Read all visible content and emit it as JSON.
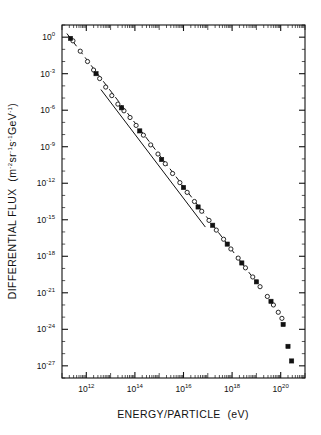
{
  "chart_data": {
    "type": "scatter",
    "title": "",
    "xlabel": "ENERGY/PARTICLE  (eV)",
    "ylabel": "DIFFERENTIAL FLUX  (m⁻²sr⁻¹s⁻¹GeV⁻¹)",
    "xscale": "log",
    "yscale": "log",
    "xlim": [
      100000000000.0,
      1e+21
    ],
    "ylim": [
      1e-28,
      10.0
    ],
    "grid": false,
    "legend": "none",
    "x_tick_labels": [
      "10^12",
      "10^14",
      "10^16",
      "10^18",
      "10^20"
    ],
    "x_tick_exponents": [
      12,
      14,
      16,
      18,
      20
    ],
    "y_tick_labels": [
      "10^0",
      "10^-3",
      "10^-6",
      "10^-9",
      "10^-12",
      "10^-15",
      "10^-18",
      "10^-21",
      "10^-24",
      "10^-27"
    ],
    "y_tick_exponents": [
      0,
      -3,
      -6,
      -9,
      -12,
      -15,
      -18,
      -21,
      -24,
      -27
    ],
    "series": [
      {
        "name": "open-circles",
        "marker": "open-circle",
        "points": [
          [
            11.45,
            -0.3
          ],
          [
            11.75,
            -1.15
          ],
          [
            12.05,
            -2.0
          ],
          [
            12.3,
            -2.7
          ],
          [
            12.55,
            -3.4
          ],
          [
            12.8,
            -4.1
          ],
          [
            13.05,
            -4.8
          ],
          [
            13.3,
            -5.5
          ],
          [
            13.55,
            -6.05
          ],
          [
            13.8,
            -6.6
          ],
          [
            14.05,
            -7.25
          ],
          [
            14.35,
            -8.05
          ],
          [
            14.65,
            -8.85
          ],
          [
            14.95,
            -9.6
          ],
          [
            15.25,
            -10.4
          ],
          [
            15.55,
            -11.2
          ],
          [
            15.85,
            -11.95
          ],
          [
            16.15,
            -12.75
          ],
          [
            16.45,
            -13.5
          ],
          [
            16.75,
            -14.3
          ],
          [
            17.05,
            -15.05
          ],
          [
            17.35,
            -15.85
          ],
          [
            17.65,
            -16.6
          ],
          [
            17.95,
            -17.4
          ],
          [
            18.25,
            -18.15
          ],
          [
            18.55,
            -18.95
          ],
          [
            18.85,
            -19.7
          ],
          [
            19.15,
            -20.5
          ],
          [
            19.45,
            -21.3
          ],
          [
            19.7,
            -22.0
          ],
          [
            19.9,
            -22.6
          ],
          [
            20.05,
            -23.1
          ]
        ]
      },
      {
        "name": "filled-squares",
        "marker": "filled-square",
        "points": [
          [
            11.35,
            -0.1
          ],
          [
            12.4,
            -3.0
          ],
          [
            13.45,
            -5.8
          ],
          [
            14.2,
            -7.7
          ],
          [
            15.1,
            -10.05
          ],
          [
            16.0,
            -12.35
          ],
          [
            16.6,
            -13.95
          ],
          [
            17.2,
            -15.45
          ],
          [
            17.8,
            -17.0
          ],
          [
            18.4,
            -18.55
          ],
          [
            19.0,
            -20.1
          ],
          [
            19.6,
            -21.7
          ],
          [
            20.1,
            -23.6
          ],
          [
            20.3,
            -25.4
          ],
          [
            20.45,
            -26.6
          ]
        ]
      }
    ],
    "reference_lines": [
      {
        "name": "solid-power-law",
        "style": "solid",
        "x_start": 12.6,
        "y_start": -4.3,
        "x_end": 16.9,
        "y_end": -15.6
      },
      {
        "name": "dashed-power-law",
        "style": "dashed",
        "x_start": 11.2,
        "y_start": 0.3,
        "x_end": 18.95,
        "y_end": -20.0
      }
    ]
  },
  "axes": {
    "y_title_text": "DIFFERENTIAL FLUX",
    "y_units_open": "(m",
    "y_units_rest": "sr",
    "x_title_text": "ENERGY/PARTICLE",
    "x_units": "(eV)"
  }
}
